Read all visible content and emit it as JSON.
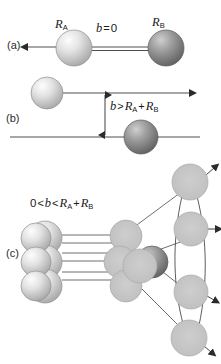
{
  "figure": {
    "type": "collision-geometry-diagram",
    "background": "#ffffff",
    "ink": "#1a1a1a"
  },
  "panels": {
    "a": {
      "label": "(a)",
      "condition": {
        "b": "b",
        "rel": "=",
        "rhs": "0"
      },
      "condition_text": "b = 0",
      "description": "head-on collision, zero impact parameter",
      "sphere_a_label": {
        "symbol": "R",
        "sub": "A"
      },
      "sphere_b_label": {
        "symbol": "R",
        "sub": "B"
      },
      "sphere_a_label_text": "RA",
      "sphere_b_label_text": "RB"
    },
    "b": {
      "label": "(b)",
      "condition_text": "b > RA + RB",
      "condition": {
        "lhs": "b",
        "rel": ">",
        "r1": "R",
        "r1sub": "A",
        "plus": "+",
        "r2": "R",
        "r2sub": "B"
      },
      "description": "miss, impact parameter larger than sum of radii"
    },
    "c": {
      "label": "(c)",
      "condition_text": "0 < b < RA + RB",
      "condition": {
        "zero": "0",
        "rel1": "<",
        "b": "b",
        "rel2": "<",
        "r1": "R",
        "r1sub": "A",
        "plus": "+",
        "r2": "R",
        "r2sub": "B"
      },
      "description": "glancing collision producing scattered products"
    }
  },
  "colors": {
    "sphere_light": "#d9d9d9",
    "sphere_light_edge": "#9a9a9a",
    "sphere_dark": "#8a8a8a",
    "sphere_dark_edge": "#5a5a5a",
    "sphere_flat": "#c4c4c4",
    "sphere_flat_edge": "#a8a8a8",
    "line": "#3a3a3a"
  },
  "symbols": {
    "R": "R",
    "b": "b",
    "sub_a": "A",
    "sub_b": "B",
    "equals": "=",
    "greater": ">",
    "less": "<",
    "plus": "+",
    "zero": "0"
  }
}
